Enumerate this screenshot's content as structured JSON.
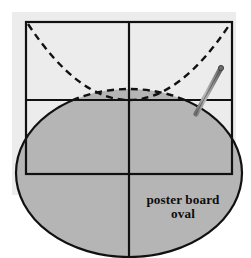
{
  "figure": {
    "caption_lines": [
      "poster board",
      "oval"
    ],
    "caption_line1": "poster board",
    "caption_line2": "oval",
    "colors": {
      "backdrop_panel": "#ececec",
      "oval_fill": "#b5b5b5",
      "outline": "#111111",
      "pointer_body": "#9a9a9a",
      "pointer_edge": "#5e5e5e",
      "page_background": "#ffffff"
    },
    "geometry": {
      "backdrop_panel": {
        "x": 12,
        "y": 12,
        "width": 224,
        "height": 183
      },
      "frame_rect": {
        "left": 26,
        "top": 22,
        "right": 232,
        "bottom": 174
      },
      "horizontal_midline_y": 100,
      "vertical_centerline_x": 129,
      "oval": {
        "center_x": 129,
        "center_y": 173,
        "radius_x": 113,
        "radius_y": 84
      },
      "parabola": {
        "vertex_x": 129,
        "vertex_y": 100,
        "left_end": {
          "x": 28,
          "y": 24
        },
        "right_end": {
          "x": 230,
          "y": 24
        }
      },
      "pointer": {
        "tip_x": 221,
        "tip_y": 68,
        "base_x": 196,
        "base_y": 114
      }
    },
    "strokes": {
      "frame_width": 2.2,
      "oval_solid_width": 2.2,
      "oval_dashed_width": 2.4,
      "parabola_dash_width": 2.4,
      "dash_pattern": "7 5"
    }
  }
}
